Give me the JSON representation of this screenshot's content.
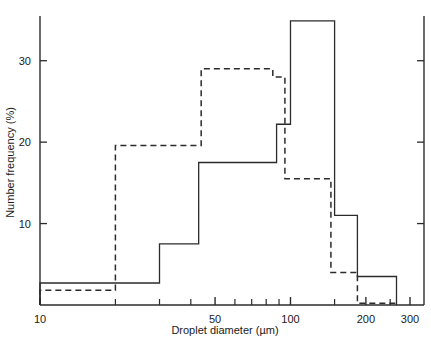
{
  "chart_data": {
    "type": "bar",
    "subtype": "overlaid-step-histogram",
    "title": "",
    "xlabel": "Droplet diameter (µm)",
    "ylabel": "Number frequency (%)",
    "xscale": "log",
    "yscale": "linear",
    "xlim": [
      10,
      300
    ],
    "ylim": [
      0,
      35
    ],
    "grid": false,
    "legend": "none",
    "xticks_labeled": [
      10,
      50,
      100,
      200,
      300
    ],
    "xtick_labels": [
      "10",
      "50",
      "100",
      "200",
      "300"
    ],
    "xticks_minor": [
      20,
      30,
      40,
      60,
      70,
      80,
      90,
      150,
      250
    ],
    "yticks": [
      10,
      20,
      30
    ],
    "ytick_labels": [
      "10",
      "20",
      "30"
    ],
    "series": [
      {
        "name": "solid",
        "style": "solid",
        "color": "#2b2b2b",
        "bins": [
          {
            "x0": 10,
            "x1": 30,
            "value": 2.7
          },
          {
            "x0": 30,
            "x1": 43,
            "value": 7.5
          },
          {
            "x0": 43,
            "x1": 88,
            "value": 17.5
          },
          {
            "x0": 88,
            "x1": 100,
            "value": 22.2
          },
          {
            "x0": 100,
            "x1": 150,
            "value": 34.9
          },
          {
            "x0": 150,
            "x1": 185,
            "value": 11.0
          },
          {
            "x0": 185,
            "x1": 265,
            "value": 3.5
          }
        ]
      },
      {
        "name": "dashed",
        "style": "dashed",
        "color": "#2b2b2b",
        "bins": [
          {
            "x0": 10,
            "x1": 20,
            "value": 1.8
          },
          {
            "x0": 20,
            "x1": 44,
            "value": 19.6
          },
          {
            "x0": 44,
            "x1": 85,
            "value": 29.0
          },
          {
            "x0": 85,
            "x1": 95,
            "value": 28.0
          },
          {
            "x0": 95,
            "x1": 145,
            "value": 15.5
          },
          {
            "x0": 145,
            "x1": 185,
            "value": 4.0
          },
          {
            "x0": 185,
            "x1": 265,
            "value": 0.2
          }
        ]
      }
    ]
  },
  "figure": {
    "background": "#ffffff",
    "axis_color": "#2b2b2b",
    "x_axis_title": "Droplet diameter (µm)",
    "y_axis_title": "Number frequency (%)"
  }
}
